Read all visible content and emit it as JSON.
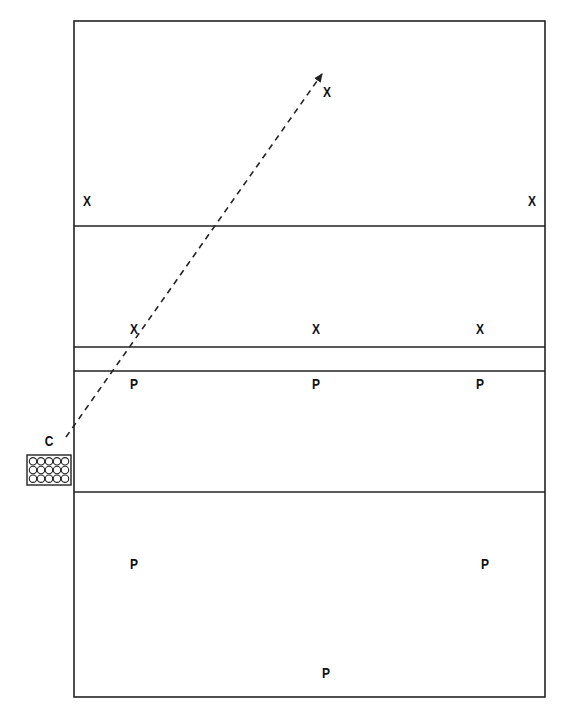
{
  "diagram": {
    "type": "volleyball-drill",
    "line_color": "#222222",
    "background": "#ffffff",
    "court": {
      "x": 74,
      "y": 21,
      "width": 471,
      "height": 676
    },
    "lines": [
      {
        "name": "attack-line-far",
        "y": 226
      },
      {
        "name": "net-top",
        "y": 347
      },
      {
        "name": "net-bottom",
        "y": 371
      },
      {
        "name": "attack-line-near",
        "y": 492
      }
    ],
    "players": [
      {
        "label": "X",
        "x": 327,
        "y": 91,
        "name": "player-x-far-center"
      },
      {
        "label": "X",
        "x": 87,
        "y": 200,
        "name": "player-x-far-left"
      },
      {
        "label": "X",
        "x": 532,
        "y": 200,
        "name": "player-x-far-right"
      },
      {
        "label": "X",
        "x": 134,
        "y": 328,
        "name": "player-x-net-left"
      },
      {
        "label": "X",
        "x": 316,
        "y": 328,
        "name": "player-x-net-center"
      },
      {
        "label": "X",
        "x": 480,
        "y": 328,
        "name": "player-x-net-right"
      },
      {
        "label": "P",
        "x": 134,
        "y": 383,
        "name": "player-p-net-left"
      },
      {
        "label": "P",
        "x": 316,
        "y": 383,
        "name": "player-p-net-center"
      },
      {
        "label": "P",
        "x": 480,
        "y": 383,
        "name": "player-p-net-right"
      },
      {
        "label": "P",
        "x": 134,
        "y": 563,
        "name": "player-p-back-left"
      },
      {
        "label": "P",
        "x": 485,
        "y": 563,
        "name": "player-p-back-right"
      },
      {
        "label": "P",
        "x": 326,
        "y": 672,
        "name": "player-p-back-center"
      }
    ],
    "coach": {
      "label": "C",
      "x": 49,
      "y": 440
    },
    "ball_cart": {
      "x": 27,
      "y": 455,
      "width": 44,
      "height": 30,
      "rows": 3,
      "cols": 5
    },
    "pass_arrow": {
      "x1": 66,
      "y1": 437,
      "x2": 322,
      "y2": 74,
      "style": "dashed"
    }
  }
}
